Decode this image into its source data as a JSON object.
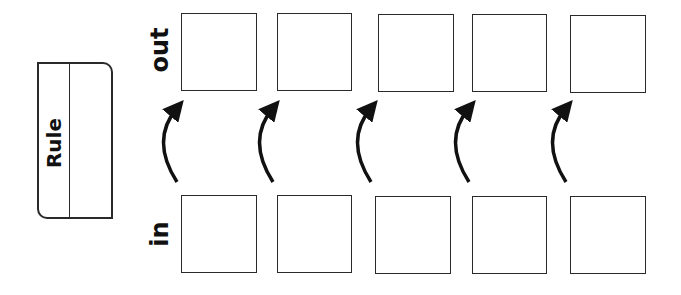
{
  "rule": {
    "label": "Rule",
    "value": ""
  },
  "labels": {
    "out": "out",
    "in": "in"
  },
  "out_cells": [
    "",
    "",
    "",
    "",
    ""
  ],
  "in_cells": [
    "",
    "",
    "",
    "",
    ""
  ],
  "arrows": {
    "count": 5,
    "direction": "in-to-out",
    "icon": "curved-arrow-up-icon"
  },
  "colors": {
    "stroke": "#2a2a2a",
    "text": "#111111",
    "background": "#ffffff"
  }
}
